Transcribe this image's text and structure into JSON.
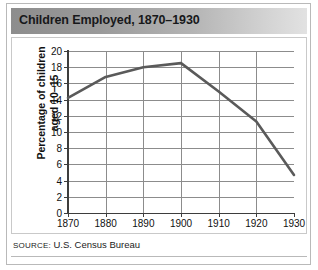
{
  "figure": {
    "title": "Children Employed, 1870–1930",
    "source_label": "SOURCE:",
    "source_text": "U.S. Census Bureau"
  },
  "chart_data": {
    "type": "line",
    "title": "Children Employed, 1870–1930",
    "xlabel": "",
    "ylabel_line1": "Percentage of children",
    "ylabel_line2": "aged 10–15",
    "x": [
      1870,
      1880,
      1890,
      1900,
      1910,
      1920,
      1930
    ],
    "values": [
      14.2,
      16.8,
      18.0,
      18.5,
      15.0,
      11.3,
      4.7
    ],
    "categories": [
      "1870",
      "1880",
      "1890",
      "1900",
      "1910",
      "1920",
      "1930"
    ],
    "xticks": [
      "1870",
      "1880",
      "1890",
      "1900",
      "1910",
      "1920",
      "1930"
    ],
    "yticks": [
      "0",
      "2",
      "4",
      "6",
      "8",
      "10",
      "12",
      "14",
      "16",
      "18",
      "20"
    ],
    "xlim": [
      1870,
      1930
    ],
    "ylim": [
      0,
      20
    ],
    "grid": true,
    "legend": "none",
    "line_color": "#5a5a5a",
    "grid_color": "#8c8c8c"
  }
}
